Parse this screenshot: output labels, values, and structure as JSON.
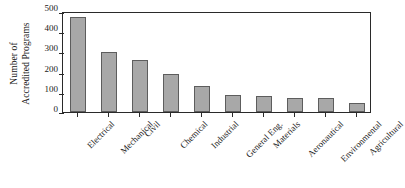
{
  "chart_data": {
    "type": "bar",
    "title": "",
    "xlabel": "",
    "ylabel": "Number of Accredited Programs",
    "ylabel_lines": [
      "Number of",
      "Accredited Programs"
    ],
    "ylim": [
      0,
      500
    ],
    "yticks": [
      0,
      100,
      200,
      300,
      400,
      500
    ],
    "ytick_labels": [
      "0",
      "100",
      "200",
      "300",
      "400",
      "500"
    ],
    "grid": false,
    "legend": "none",
    "orientation": "vertical",
    "categories": [
      "Electrical",
      "Mechanical",
      "Civil",
      "Chemical",
      "Industrial",
      "General Eng.",
      "Materials",
      "Aeronautical",
      "Environmental",
      "Agricultural"
    ],
    "values": [
      468,
      297,
      258,
      186,
      130,
      85,
      79,
      71,
      68,
      44
    ],
    "bar_color": "#a8a8a8",
    "bar_edge_color": "#5d5d5d",
    "axis_color": "#2a2a2a",
    "background_color": "#ffffff",
    "xtick_label_rotation": 45
  }
}
